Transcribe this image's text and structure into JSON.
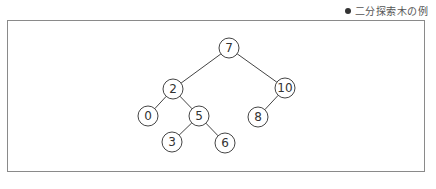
{
  "caption": {
    "bullet": "●",
    "text": "二分探索木の例"
  },
  "tree": {
    "nodes": [
      {
        "id": "n7",
        "label": "7",
        "x": 229,
        "y": 48
      },
      {
        "id": "n2",
        "label": "2",
        "x": 173,
        "y": 89
      },
      {
        "id": "n10",
        "label": "10",
        "x": 285,
        "y": 88
      },
      {
        "id": "n0",
        "label": "0",
        "x": 148,
        "y": 116
      },
      {
        "id": "n5",
        "label": "5",
        "x": 199,
        "y": 116
      },
      {
        "id": "n8",
        "label": "8",
        "x": 258,
        "y": 117
      },
      {
        "id": "n3",
        "label": "3",
        "x": 172,
        "y": 142
      },
      {
        "id": "n6",
        "label": "6",
        "x": 225,
        "y": 143
      }
    ],
    "edges": [
      [
        "n7",
        "n2"
      ],
      [
        "n7",
        "n10"
      ],
      [
        "n2",
        "n0"
      ],
      [
        "n2",
        "n5"
      ],
      [
        "n10",
        "n8"
      ],
      [
        "n5",
        "n3"
      ],
      [
        "n5",
        "n6"
      ]
    ],
    "radius": 10
  }
}
